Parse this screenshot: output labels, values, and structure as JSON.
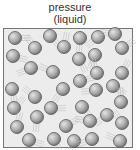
{
  "title": {
    "line1": "pressure",
    "line2": "(liquid)"
  },
  "colors": {
    "sphere_light": "#d8d8d8",
    "sphere_dark": "#7a7a7a",
    "box_bg": "#ececec",
    "border": "#777777"
  },
  "particles": [
    [
      15,
      38
    ],
    [
      50,
      36
    ],
    [
      80,
      38
    ],
    [
      98,
      37
    ],
    [
      115,
      34
    ],
    [
      35,
      48
    ],
    [
      64,
      47
    ],
    [
      122,
      48
    ],
    [
      13,
      56
    ],
    [
      79,
      59
    ],
    [
      95,
      55
    ],
    [
      31,
      68
    ],
    [
      53,
      72
    ],
    [
      97,
      73
    ],
    [
      122,
      73
    ],
    [
      80,
      81
    ],
    [
      113,
      86
    ],
    [
      12,
      89
    ],
    [
      63,
      89
    ],
    [
      96,
      90
    ],
    [
      35,
      97
    ],
    [
      121,
      102
    ],
    [
      14,
      108
    ],
    [
      51,
      108
    ],
    [
      82,
      107
    ],
    [
      37,
      117
    ],
    [
      107,
      115
    ],
    [
      90,
      121
    ],
    [
      122,
      123
    ],
    [
      17,
      127
    ],
    [
      66,
      126
    ],
    [
      29,
      140
    ],
    [
      54,
      139
    ],
    [
      74,
      141
    ],
    [
      92,
      139
    ],
    [
      120,
      141
    ]
  ]
}
